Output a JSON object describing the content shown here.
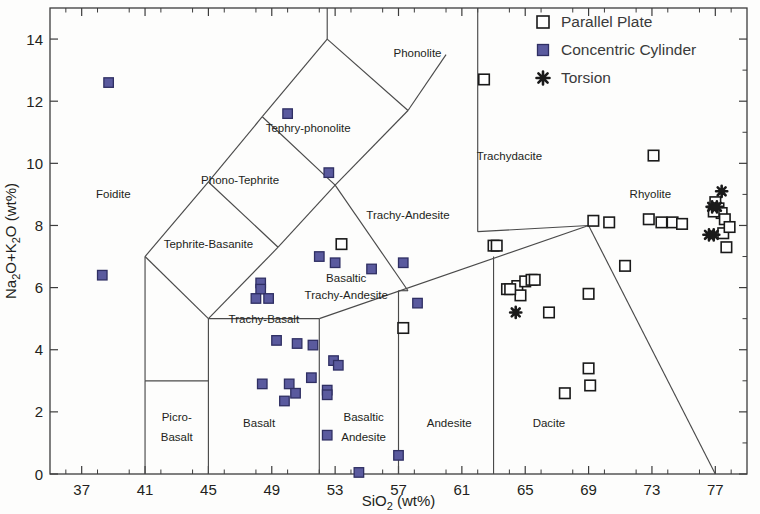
{
  "chart_data": {
    "type": "scatter",
    "title": "",
    "xlabel": "SiO₂ (wt%)",
    "ylabel": "Na₂O+K₂O (wt%)",
    "xlim": [
      35,
      79
    ],
    "ylim": [
      0,
      15
    ],
    "xticks": [
      37,
      41,
      45,
      49,
      53,
      57,
      61,
      65,
      69,
      73,
      77
    ],
    "yticks": [
      0,
      2,
      4,
      6,
      8,
      10,
      12,
      14
    ],
    "grid": false,
    "legend_position": "top-right",
    "axis_colors": {
      "axis": "#3c3c3c",
      "boundary": "#4a4a4a",
      "text": "#231f20"
    },
    "marker_colors": {
      "parallel_plate_fill": "#ffffff",
      "parallel_plate_stroke": "#1a1a1a",
      "concentric_cylinder_fill": "#5a5a9e",
      "concentric_cylinder_stroke": "#2f2f63",
      "torsion_fill": "#1a1a1a"
    },
    "series": [
      {
        "name": "Parallel Plate",
        "marker": "open-square",
        "points": [
          [
            62.4,
            12.7
          ],
          [
            73.1,
            10.25
          ],
          [
            57.3,
            4.7
          ],
          [
            63.0,
            7.35
          ],
          [
            63.2,
            7.35
          ],
          [
            53.4,
            7.4
          ],
          [
            64.5,
            6.05
          ],
          [
            64.7,
            5.75
          ],
          [
            65.0,
            6.2
          ],
          [
            65.4,
            6.25
          ],
          [
            65.6,
            6.25
          ],
          [
            66.5,
            5.2
          ],
          [
            63.85,
            5.95
          ],
          [
            64.05,
            5.95
          ],
          [
            69.0,
            5.8
          ],
          [
            69.3,
            8.15
          ],
          [
            70.3,
            8.1
          ],
          [
            69.0,
            3.4
          ],
          [
            69.1,
            2.85
          ],
          [
            67.5,
            2.6
          ],
          [
            72.8,
            8.2
          ],
          [
            73.6,
            8.1
          ],
          [
            74.3,
            8.1
          ],
          [
            74.9,
            8.05
          ],
          [
            71.3,
            6.7
          ],
          [
            77.0,
            8.75
          ],
          [
            77.2,
            8.55
          ],
          [
            77.4,
            8.4
          ],
          [
            77.6,
            8.2
          ],
          [
            77.5,
            7.75
          ],
          [
            77.9,
            7.95
          ],
          [
            77.7,
            7.3
          ],
          [
            76.9,
            8.45
          ]
        ]
      },
      {
        "name": "Concentric Cylinder",
        "marker": "filled-square",
        "points": [
          [
            38.7,
            12.6
          ],
          [
            38.3,
            6.4
          ],
          [
            50.0,
            11.6
          ],
          [
            52.6,
            9.7
          ],
          [
            48.3,
            6.15
          ],
          [
            48.3,
            5.95
          ],
          [
            48.0,
            5.65
          ],
          [
            48.8,
            5.65
          ],
          [
            53.0,
            6.8
          ],
          [
            55.3,
            6.6
          ],
          [
            57.3,
            6.8
          ],
          [
            52.0,
            7.0
          ],
          [
            58.2,
            5.5
          ],
          [
            49.3,
            4.3
          ],
          [
            50.6,
            4.2
          ],
          [
            51.6,
            4.15
          ],
          [
            52.9,
            3.65
          ],
          [
            53.2,
            3.5
          ],
          [
            51.5,
            3.1
          ],
          [
            50.1,
            2.9
          ],
          [
            48.4,
            2.9
          ],
          [
            50.5,
            2.6
          ],
          [
            49.8,
            2.35
          ],
          [
            52.5,
            2.7
          ],
          [
            52.5,
            2.55
          ],
          [
            52.5,
            1.25
          ],
          [
            57.0,
            0.6
          ],
          [
            54.5,
            0.05
          ]
        ]
      },
      {
        "name": "Torsion",
        "marker": "asterisk",
        "points": [
          [
            64.4,
            5.2
          ],
          [
            77.4,
            9.1
          ],
          [
            76.8,
            8.6
          ],
          [
            77.1,
            8.6
          ],
          [
            76.6,
            7.7
          ],
          [
            76.9,
            7.7
          ]
        ]
      }
    ],
    "fields": [
      {
        "name": "Foidite",
        "x": 39.0,
        "y": 9.0
      },
      {
        "name": "Phonolite",
        "x": 58.2,
        "y": 13.55
      },
      {
        "name": "Tephry-phonolite",
        "x": 51.3,
        "y": 11.15
      },
      {
        "name": "Phono-Tephrite",
        "x": 47.0,
        "y": 9.45
      },
      {
        "name": "Trachydacite",
        "x": 64.0,
        "y": 10.25
      },
      {
        "name": "Rhyolite",
        "x": 72.9,
        "y": 9.0
      },
      {
        "name": "Tephrite-Basanite",
        "x": 45.0,
        "y": 7.4
      },
      {
        "name": "Trachy-Andesite",
        "x": 57.6,
        "y": 8.35
      },
      {
        "name": "Basaltic",
        "x": 53.7,
        "y": 6.3
      },
      {
        "name": "Trachy-Andesite",
        "x": 53.7,
        "y": 5.75
      },
      {
        "name": "Trachy-Basalt",
        "x": 48.5,
        "y": 5.0
      },
      {
        "name": "Picro-",
        "x": 43.0,
        "y": 1.85
      },
      {
        "name": "Basalt",
        "x": 43.0,
        "y": 1.2
      },
      {
        "name": "Basalt",
        "x": 48.2,
        "y": 1.65
      },
      {
        "name": "Basaltic",
        "x": 54.8,
        "y": 1.85
      },
      {
        "name": "Andesite",
        "x": 54.8,
        "y": 1.2
      },
      {
        "name": "Andesite",
        "x": 60.2,
        "y": 1.65
      },
      {
        "name": "Dacite",
        "x": 66.5,
        "y": 1.65
      }
    ]
  },
  "legend": {
    "entries": [
      {
        "label": "Parallel Plate",
        "marker": "open-square"
      },
      {
        "label": "Concentric Cylinder",
        "marker": "filled-square"
      },
      {
        "label": "Torsion",
        "marker": "asterisk"
      }
    ]
  },
  "axes": {
    "x_title": "SiO₂ (wt%)",
    "y_title": "Na₂O+K₂O (wt%)",
    "x_tick_labels": [
      "37",
      "41",
      "45",
      "49",
      "53",
      "57",
      "61",
      "65",
      "69",
      "73",
      "77"
    ],
    "y_tick_labels": [
      "0",
      "2",
      "4",
      "6",
      "8",
      "10",
      "12",
      "14"
    ]
  }
}
